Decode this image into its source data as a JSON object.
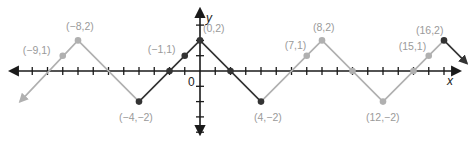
{
  "chart_data": {
    "type": "line",
    "title": "",
    "xlabel": "x",
    "ylabel": "y",
    "origin_label": "0",
    "grid": false,
    "xlim": [
      -12.5,
      17
    ],
    "ylim": [
      -4.2,
      4
    ],
    "colors": {
      "axis": "#1a1a1a",
      "dark": "#333333",
      "light": "#b0b0b0",
      "label": "#9a9a9a"
    },
    "segments": [
      {
        "style": "light",
        "points": [
          [
            -11.8,
            -2
          ],
          [
            -8,
            2
          ],
          [
            -4,
            -2
          ]
        ],
        "start_arrow": true
      },
      {
        "style": "dark",
        "points": [
          [
            -4,
            -2
          ],
          [
            0,
            2
          ],
          [
            4,
            -2
          ]
        ]
      },
      {
        "style": "light",
        "points": [
          [
            4,
            -2
          ],
          [
            8,
            2
          ],
          [
            12,
            -2
          ],
          [
            16,
            2
          ]
        ]
      },
      {
        "style": "dark",
        "points": [
          [
            16,
            2
          ],
          [
            17.5,
            0.5
          ]
        ],
        "end_arrow": true
      }
    ],
    "points": [
      {
        "x": -9,
        "y": 1,
        "label": "(−9,1)",
        "style": "light"
      },
      {
        "x": -8,
        "y": 2,
        "label": "(−8,2)",
        "style": "light"
      },
      {
        "x": -4,
        "y": -2,
        "label": "(−4,−2)",
        "style": "dark"
      },
      {
        "x": -2,
        "y": 0,
        "label": "",
        "style": "dark"
      },
      {
        "x": -1,
        "y": 1,
        "label": "(−1,1)",
        "style": "dark"
      },
      {
        "x": 0,
        "y": 2,
        "label": "(0,2)",
        "style": "dark"
      },
      {
        "x": 2,
        "y": 0,
        "label": "",
        "style": "dark"
      },
      {
        "x": 4,
        "y": -2,
        "label": "(4,−2)",
        "style": "dark"
      },
      {
        "x": 7,
        "y": 1,
        "label": "(7,1)",
        "style": "light"
      },
      {
        "x": 8,
        "y": 2,
        "label": "(8,2)",
        "style": "light"
      },
      {
        "x": 10,
        "y": 0,
        "label": "",
        "style": "light"
      },
      {
        "x": 12,
        "y": -2,
        "label": "(12,−2)",
        "style": "light"
      },
      {
        "x": 14,
        "y": 0,
        "label": "",
        "style": "light"
      },
      {
        "x": 15,
        "y": 1,
        "label": "(15,1)",
        "style": "light"
      },
      {
        "x": 16,
        "y": 2,
        "label": "(16,2)",
        "style": "dark"
      }
    ],
    "x_ticks": [
      -11,
      -10,
      -9,
      -8,
      -7,
      -6,
      -5,
      -4,
      -3,
      -2,
      -1,
      1,
      2,
      3,
      4,
      5,
      6,
      7,
      8,
      9,
      10,
      11,
      12,
      13,
      14,
      15,
      16
    ],
    "y_ticks": [
      -4,
      -3,
      -2,
      -1,
      1,
      2,
      3
    ]
  }
}
